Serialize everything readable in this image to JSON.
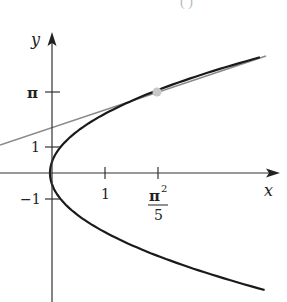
{
  "header_fragment": "(          )",
  "chart_data": {
    "type": "line",
    "title": "",
    "xlabel": "x",
    "ylabel": "y",
    "x_ticks": [
      {
        "value": 1,
        "label": "1"
      },
      {
        "value": 1.974,
        "label_num": "π²",
        "label_den": "5"
      }
    ],
    "y_ticks": [
      {
        "value": 3.1416,
        "label": "π"
      },
      {
        "value": 1,
        "label": "1"
      },
      {
        "value": -1,
        "label": "−1"
      }
    ],
    "xlim": [
      -1,
      4.3
    ],
    "ylim": [
      -5.0,
      5.3
    ],
    "grid": false,
    "legend": null,
    "series": [
      {
        "name": "curve",
        "equation": "x = y^2 / 5",
        "color": "#1a1a1a",
        "style": "solid"
      },
      {
        "name": "tangent line",
        "equation": "y = π + (5/(2π))(x − π²/5)",
        "color": "#8a8a8a",
        "style": "solid"
      }
    ],
    "points": [
      {
        "name": "tangency point",
        "x": 1.974,
        "y": 3.1416,
        "color": "#c8c8c8"
      }
    ]
  },
  "labels": {
    "x_axis": "x",
    "y_axis": "y",
    "tick_x1": "1",
    "tick_x2_num": "π",
    "tick_x2_exp": "2",
    "tick_x2_den": "5",
    "tick_ypi": "π",
    "tick_y1": "1",
    "tick_yneg1": "−1"
  }
}
